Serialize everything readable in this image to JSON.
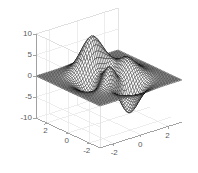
{
  "figure": {
    "name": "matlab-3d-surface-figure",
    "background_color": "#ffffff",
    "mesh_color": "#000000",
    "grid_color": "#e6e6e6",
    "axis_line_color": "#999999",
    "tick_text_color": "#5a5a5a"
  },
  "axes": {
    "z": {
      "label": "",
      "ticks": [
        "10",
        "5",
        "0",
        "-5",
        "-10"
      ],
      "values": [
        10,
        5,
        0,
        -5,
        -10
      ],
      "range": [
        -10,
        10
      ]
    },
    "x": {
      "label": "",
      "ticks": [
        "-2",
        "0",
        "2"
      ],
      "values": [
        -2,
        0,
        2
      ],
      "range": [
        -3,
        3
      ]
    },
    "y": {
      "label": "",
      "ticks": [
        "2",
        "0",
        "-2"
      ],
      "values": [
        2,
        0,
        -2
      ],
      "range": [
        -3,
        3
      ]
    }
  },
  "chart_data": {
    "type": "surface",
    "title": "",
    "xlabel": "",
    "ylabel": "",
    "zlabel": "",
    "function": "peaks",
    "formula": "z = 3*(1-x)^2*exp(-x^2-(y+1)^2) - 10*(x/5 - x^3 - y^5)*exp(-x^2-y^2) - (1/3)*exp(-(x+1)^2 - y^2)",
    "x_range": [
      -3,
      3
    ],
    "y_range": [
      -3,
      3
    ],
    "z_range": [
      -10,
      10
    ],
    "grid_n": 49,
    "xticks": [
      -2,
      0,
      2
    ],
    "yticks": [
      -2,
      0,
      2
    ],
    "zticks": [
      -10,
      -5,
      0,
      5,
      10
    ],
    "grid": true,
    "legend": false,
    "mesh_style": "wireframe",
    "view_azimuth": -37.5,
    "view_elevation": 30,
    "z_min_observed": -6.5,
    "z_max_observed": 8.1
  },
  "z_ticks_render": [
    {
      "label": "10",
      "value": 10
    },
    {
      "label": "5",
      "value": 5
    },
    {
      "label": "0",
      "value": 0
    },
    {
      "label": "-5",
      "value": -5
    },
    {
      "label": "-10",
      "value": -10
    }
  ],
  "x_ticks_render": [
    {
      "label": "-2",
      "value": -2
    },
    {
      "label": "0",
      "value": 0
    },
    {
      "label": "2",
      "value": 2
    }
  ],
  "y_ticks_render": [
    {
      "label": "2",
      "value": 2
    },
    {
      "label": "0",
      "value": 0
    },
    {
      "label": "-2",
      "value": -2
    }
  ]
}
